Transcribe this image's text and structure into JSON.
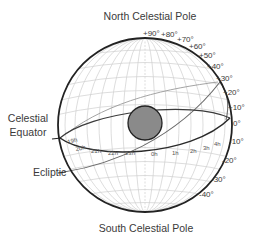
{
  "diagram": {
    "title_top": "North Celestial Pole",
    "title_bottom": "South Celestial Pole",
    "labels": {
      "equator_line1": "Celestial",
      "equator_line2": "Equator",
      "ecliptic": "Ecliptic"
    },
    "declination_ticks": [
      "+90°",
      "+80°",
      "+70°",
      "+60°",
      "+50°",
      "+40°",
      "+30°",
      "+20°",
      "+10°",
      "0°",
      "-10°",
      "-20°",
      "-30°",
      "-40°"
    ],
    "right_ascension_ticks": [
      "19h",
      "20h",
      "21h",
      "22h",
      "23h",
      "0h",
      "1h",
      "2h",
      "3h",
      "4h"
    ],
    "colors": {
      "sphere_outline": "#222222",
      "grid": "#c8c8c8",
      "equator": "#2a2a2a",
      "ecliptic": "#555555",
      "central_body_fill": "#8a8a8a",
      "text": "#3a3a3a"
    }
  }
}
